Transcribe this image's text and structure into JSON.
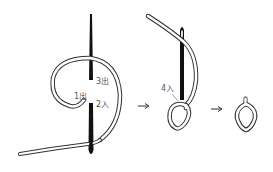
{
  "diagram": {
    "title": "",
    "steps": [
      {
        "id": "step1",
        "labels": [
          "1出",
          "2入",
          "3出"
        ]
      },
      {
        "id": "step2",
        "labels": [
          "4入"
        ]
      },
      {
        "id": "step3",
        "labels": []
      }
    ],
    "labels": {
      "p1": "1出",
      "p2": "2入",
      "p3": "3出",
      "p4": "4入"
    },
    "arrows": [
      "→",
      "→"
    ],
    "colors": {
      "line": "#333333",
      "needle": "#111111",
      "label": "#555555",
      "background": "#ffffff"
    }
  }
}
